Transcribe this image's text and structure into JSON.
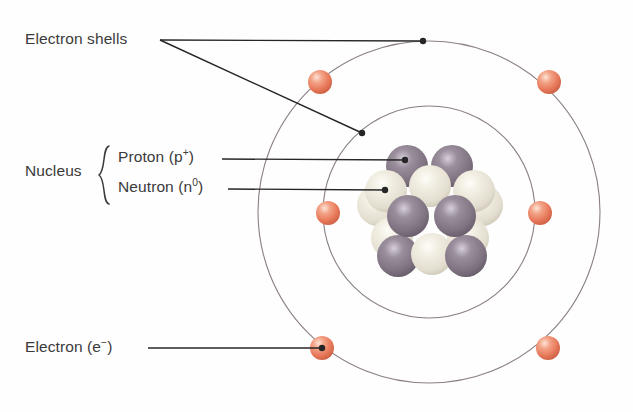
{
  "figure": {
    "background_color": "#fefefe",
    "text_color": "#3a3a3a"
  },
  "labels": {
    "electron_shells": "Electron shells",
    "nucleus": "Nucleus",
    "proton": "Proton (p",
    "proton_charge": "+",
    "proton_close": ")",
    "neutron": "Neutron (n",
    "neutron_charge": "0",
    "neutron_close": ")",
    "electron": "Electron (e",
    "electron_charge": "−",
    "electron_close": ")"
  },
  "diagram": {
    "center": {
      "x": 429,
      "y": 212
    },
    "shells": [
      {
        "name": "inner-shell",
        "radius": 106,
        "color": "#8a7f85",
        "stroke_width": 1.1
      },
      {
        "name": "outer-shell",
        "radius": 171,
        "color": "#8a7f85",
        "stroke_width": 1.1
      }
    ],
    "electron_color": "#e8795a",
    "electron_highlight": "#fbd9c9",
    "electron_radius": 12,
    "electrons": [
      {
        "shell": "outer",
        "x": 320,
        "y": 82
      },
      {
        "shell": "outer",
        "x": 549,
        "y": 82
      },
      {
        "shell": "inner",
        "x": 328,
        "y": 213
      },
      {
        "shell": "inner",
        "x": 540,
        "y": 213
      },
      {
        "shell": "outer",
        "x": 322,
        "y": 348
      },
      {
        "shell": "outer",
        "x": 548,
        "y": 348
      }
    ],
    "proton_color": "#7e7280",
    "proton_highlight": "#cfc7d0",
    "neutron_color": "#e8e4d6",
    "neutron_highlight": "#fbfaf4",
    "nucleon_radius": 21,
    "nucleons": [
      {
        "type": "neutron",
        "x": 378,
        "y": 205
      },
      {
        "type": "neutron",
        "x": 482,
        "y": 205
      },
      {
        "type": "neutron",
        "x": 392,
        "y": 238
      },
      {
        "type": "neutron",
        "x": 468,
        "y": 238
      },
      {
        "type": "proton",
        "x": 398,
        "y": 256
      },
      {
        "type": "neutron",
        "x": 432,
        "y": 254
      },
      {
        "type": "proton",
        "x": 466,
        "y": 256
      },
      {
        "type": "proton",
        "x": 407,
        "y": 166
      },
      {
        "type": "proton",
        "x": 452,
        "y": 166
      },
      {
        "type": "neutron",
        "x": 386,
        "y": 191
      },
      {
        "type": "neutron",
        "x": 430,
        "y": 186
      },
      {
        "type": "neutron",
        "x": 474,
        "y": 191
      },
      {
        "type": "proton",
        "x": 408,
        "y": 216
      },
      {
        "type": "proton",
        "x": 455,
        "y": 216
      }
    ],
    "leader_line_color": "#262626",
    "leaders": [
      {
        "name": "electron-shells-to-outer",
        "points": "160,40 423,41",
        "dot": {
          "x": 423,
          "y": 41
        }
      },
      {
        "name": "electron-shells-to-inner",
        "points": "160,40 362,133",
        "dot": {
          "x": 362,
          "y": 133
        }
      },
      {
        "name": "proton-leader",
        "points": "222,159 405,160",
        "dot": {
          "x": 405,
          "y": 160
        }
      },
      {
        "name": "neutron-leader",
        "points": "228,189 385,190",
        "dot": {
          "x": 385,
          "y": 190
        }
      },
      {
        "name": "electron-leader",
        "points": "148,348 322,348",
        "dot": {
          "x": 322,
          "y": 348
        }
      }
    ],
    "brace": {
      "x": 101,
      "y_top": 146,
      "y_bottom": 204,
      "color": "#3a3a3a"
    }
  }
}
